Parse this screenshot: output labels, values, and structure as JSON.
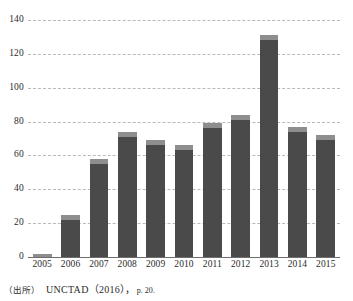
{
  "chart_data": {
    "type": "bar",
    "title": "",
    "subtitle": "",
    "xlabel": "",
    "ylabel": "",
    "categories": [
      "2005",
      "2006",
      "2007",
      "2008",
      "2009",
      "2010",
      "2011",
      "2012",
      "2013",
      "2014",
      "2015"
    ],
    "values": [
      2,
      25,
      58,
      74,
      69,
      66,
      79,
      84,
      131,
      77,
      72
    ],
    "segments": {
      "note": "each bar is drawn as a dark body with a lighter grey cap at the top",
      "cap_share": [
        2,
        3,
        3,
        3,
        3,
        3,
        3,
        3,
        3,
        3,
        3
      ]
    },
    "series": [
      {
        "name": "value",
        "values": [
          2,
          25,
          58,
          74,
          69,
          66,
          79,
          84,
          131,
          77,
          72
        ]
      }
    ],
    "ylim": [
      0,
      140
    ],
    "yticks": [
      0,
      20,
      40,
      60,
      80,
      100,
      120,
      140
    ],
    "ytick_labels": [
      "0",
      "20",
      "40",
      "60",
      "80",
      "100",
      "120",
      "140"
    ],
    "grid": true,
    "grid_style": "dashed-horizontal",
    "legend": false,
    "legend_position": "none",
    "colors": {
      "bar_body": "#4a4a4a",
      "bar_cap": "#8e8e8e",
      "gridline": "#b9b9b9",
      "axis": "#6f6f6f",
      "text": "#2b2b2b",
      "background": "#ffffff"
    }
  },
  "source_note": {
    "prefix": "（出所）",
    "body": "UNCTAD（2016），",
    "page": "p. 20."
  }
}
